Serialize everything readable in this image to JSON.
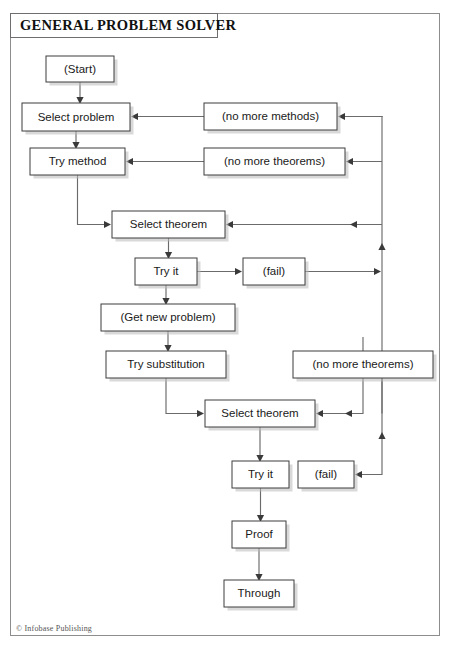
{
  "page": {
    "title": "GENERAL PROBLEM SOLVER",
    "credit": "© Infobase Publishing",
    "background_color": "#ffffff",
    "frame_color": "#8d8d8d"
  },
  "chart_data": {
    "type": "diagram",
    "diagram_kind": "flowchart",
    "title": "GENERAL PROBLEM SOLVER",
    "node_fill": "#ffffff",
    "node_stroke": "#3d3d3d",
    "edge_color": "#6b6b6b",
    "nodes": [
      {
        "id": "start",
        "label": "(Start)",
        "x": 46,
        "y": 56,
        "w": 68,
        "h": 26
      },
      {
        "id": "select_prob",
        "label": "Select problem",
        "x": 22,
        "y": 103,
        "w": 108,
        "h": 28
      },
      {
        "id": "try_method",
        "label": "Try method",
        "x": 30,
        "y": 148,
        "w": 95,
        "h": 27
      },
      {
        "id": "no_methods",
        "label": "(no more methods)",
        "x": 204,
        "y": 103,
        "w": 133,
        "h": 27
      },
      {
        "id": "no_theorems1",
        "label": "(no more theorems)",
        "x": 204,
        "y": 148,
        "w": 141,
        "h": 27
      },
      {
        "id": "select_thm1",
        "label": "Select theorem",
        "x": 112,
        "y": 211,
        "w": 113,
        "h": 27
      },
      {
        "id": "try_it1",
        "label": "Try it",
        "x": 135,
        "y": 258,
        "w": 62,
        "h": 27
      },
      {
        "id": "fail1",
        "label": "(fail)",
        "x": 243,
        "y": 258,
        "w": 62,
        "h": 27
      },
      {
        "id": "get_new_prob",
        "label": "(Get new problem)",
        "x": 101,
        "y": 304,
        "w": 134,
        "h": 27
      },
      {
        "id": "try_subst",
        "label": "Try substitution",
        "x": 106,
        "y": 351,
        "w": 120,
        "h": 27
      },
      {
        "id": "no_theorems2",
        "label": "(no more theorems)",
        "x": 293,
        "y": 351,
        "w": 140,
        "h": 27
      },
      {
        "id": "select_thm2",
        "label": "Select theorem",
        "x": 205,
        "y": 400,
        "w": 110,
        "h": 27
      },
      {
        "id": "try_it2",
        "label": "Try it",
        "x": 232,
        "y": 461,
        "w": 57,
        "h": 27
      },
      {
        "id": "fail2",
        "label": "(fail)",
        "x": 298,
        "y": 461,
        "w": 56,
        "h": 27
      },
      {
        "id": "proof",
        "label": "Proof",
        "x": 232,
        "y": 521,
        "w": 54,
        "h": 27
      },
      {
        "id": "through",
        "label": "Through",
        "x": 224,
        "y": 580,
        "w": 70,
        "h": 27
      }
    ],
    "edges": [
      {
        "from": "start",
        "to": "select_prob",
        "kind": "down"
      },
      {
        "from": "select_prob",
        "to": "try_method",
        "kind": "down"
      },
      {
        "from": "no_methods",
        "to": "select_prob",
        "kind": "left"
      },
      {
        "from": "no_theorems1",
        "to": "try_method",
        "kind": "left"
      },
      {
        "from": "try_method",
        "to": "select_thm1",
        "kind": "down-right"
      },
      {
        "from": "select_thm1",
        "to": "try_it1",
        "kind": "down"
      },
      {
        "from": "try_it1",
        "to": "fail1",
        "kind": "right"
      },
      {
        "from": "fail1",
        "to": "bus_right",
        "kind": "right-to-bus"
      },
      {
        "from": "try_it1",
        "to": "get_new_prob",
        "kind": "down"
      },
      {
        "from": "get_new_prob",
        "to": "try_subst",
        "kind": "down"
      },
      {
        "from": "try_subst",
        "to": "select_thm2",
        "kind": "down-right"
      },
      {
        "from": "bus_right",
        "to": "select_thm1",
        "kind": "bus-to-left"
      },
      {
        "from": "bus_right",
        "to": "no_methods",
        "kind": "bus-to-left"
      },
      {
        "from": "bus_right",
        "to": "no_theorems1",
        "kind": "bus-to-left"
      },
      {
        "from": "no_theorems2",
        "to": "select_thm2",
        "kind": "down-left"
      },
      {
        "from": "select_thm2",
        "to": "try_it2",
        "kind": "down"
      },
      {
        "from": "try_it2",
        "to": "proof",
        "kind": "down"
      },
      {
        "from": "proof",
        "to": "through",
        "kind": "down"
      },
      {
        "from": "fail2",
        "to": "bus_lower",
        "kind": "right-loop-up"
      }
    ]
  }
}
